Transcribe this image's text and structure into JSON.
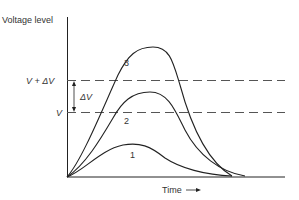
{
  "diagram": {
    "y_axis_label": "Voltage level",
    "x_axis_label": "Time",
    "levels": {
      "upper": "V + ΔV",
      "lower": "V",
      "delta": "ΔV"
    },
    "curves": [
      {
        "label": "1"
      },
      {
        "label": "2"
      },
      {
        "label": "3"
      }
    ],
    "colors": {
      "line": "#222222",
      "dashed": "#555555",
      "text": "#333333"
    }
  }
}
